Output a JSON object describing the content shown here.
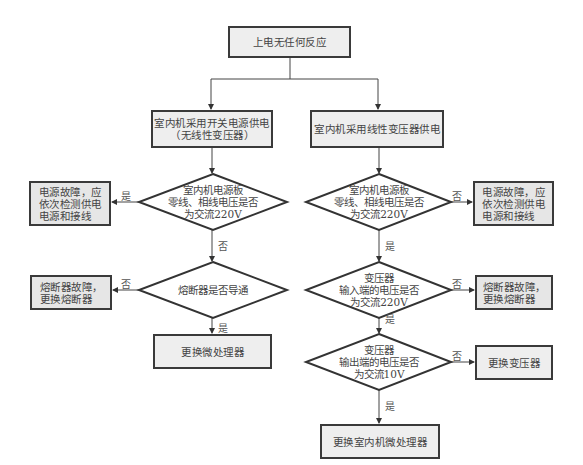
{
  "title": "上电无任何反应",
  "branches": {
    "left": {
      "header": "室内机采用开关电源供电\n（无线性变压器）",
      "decision1": {
        "text": "室内机电源板\n零线、相线电压是否\n为交流220V",
        "yes_label": "是",
        "no_label": "否",
        "yes_result": "电源故障，应\n依次检测供电\n电源和接线"
      },
      "decision2": {
        "text": "熔断器是否导通",
        "yes_label": "是",
        "no_label": "否",
        "no_result": "熔断器故障，\n更换熔断器"
      },
      "final": "更换微处理器"
    },
    "right": {
      "header": "室内机采用线性变压器供电",
      "decision1": {
        "text": "室内机电源板\n零线、相线电压是否\n为交流220V",
        "yes_label": "是",
        "no_label": "否",
        "no_result": "电源故障，应\n依次检测供电\n电源和接线"
      },
      "decision2": {
        "text": "变压器\n输入端的电压是否\n为交流220V",
        "yes_label": "是",
        "no_label": "否",
        "no_result": "熔断器故障，\n更换熔断器"
      },
      "decision3": {
        "text": "变压器\n输出端的电压是否\n为交流10V",
        "yes_label": "是",
        "no_label": "否",
        "no_result": "更换变压器"
      },
      "final": "更换室内机微处理器"
    }
  },
  "colors": {
    "stroke": "#3a3a3a",
    "box_fill": "#eeeeee",
    "text": "#444444"
  }
}
